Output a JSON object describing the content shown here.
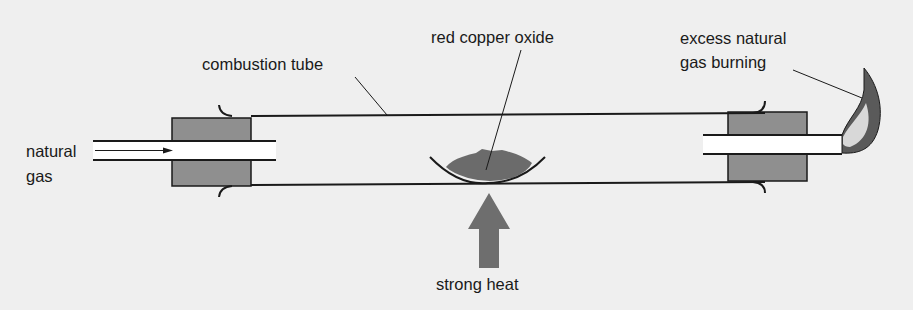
{
  "labels": {
    "combustion_tube": "combustion tube",
    "red_copper_oxide": "red copper oxide",
    "excess_gas_line1": "excess natural",
    "excess_gas_line2": "gas burning",
    "natural_gas_line1": "natural",
    "natural_gas_line2": "gas",
    "strong_heat": "strong heat"
  },
  "colors": {
    "background": "#efefef",
    "stopper": "#8f8f8f",
    "copper_oxide": "#6b6b6b",
    "heat_arrow": "#6e6e6e",
    "flame_outer": "#5a5a5a",
    "flame_inner": "#d8d8d8",
    "line": "#1a1a1a"
  }
}
